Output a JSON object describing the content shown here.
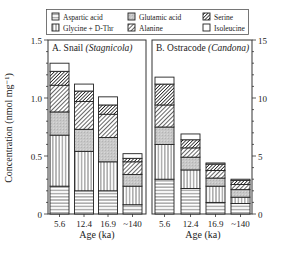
{
  "chart_data": [
    {
      "type": "bar",
      "stacked": true,
      "panel": "A",
      "title": "A. Snail (Stagnicola)",
      "title_plain": "A. Snail ",
      "title_italic": "(Stagnicola)",
      "xlabel": "Age (ka)",
      "ylabel": "Concentration (nmol mg⁻¹)",
      "ylim": [
        0,
        1.5
      ],
      "yticks": [
        "0",
        "0.5",
        "1.0",
        "1.5"
      ],
      "ytick_values": [
        0,
        0.5,
        1.0,
        1.5
      ],
      "axis_side": "left",
      "categories": [
        "5.6",
        "12.4",
        "16.9",
        "~140"
      ],
      "series": [
        {
          "name": "Aspartic acid",
          "values": [
            0.24,
            0.2,
            0.2,
            0.08
          ]
        },
        {
          "name": "Glycine + D-Thr",
          "values": [
            0.44,
            0.34,
            0.25,
            0.16
          ]
        },
        {
          "name": "Glutamic acid",
          "values": [
            0.2,
            0.19,
            0.21,
            0.1
          ]
        },
        {
          "name": "Alanine",
          "values": [
            0.23,
            0.24,
            0.2,
            0.11
          ]
        },
        {
          "name": "Serine",
          "values": [
            0.12,
            0.09,
            0.08,
            0.03
          ]
        },
        {
          "name": "Isoleucine",
          "values": [
            0.07,
            0.06,
            0.07,
            0.04
          ]
        }
      ],
      "totals": [
        1.3,
        1.12,
        1.01,
        0.52
      ]
    },
    {
      "type": "bar",
      "stacked": true,
      "panel": "B",
      "title": "B. Ostracode (Candona)",
      "title_plain": "B. Ostracode ",
      "title_italic": "(Candona)",
      "xlabel": "Age (ka)",
      "ylabel": "",
      "ylim": [
        0,
        15
      ],
      "yticks": [
        "0",
        "5",
        "10",
        "15"
      ],
      "ytick_values": [
        0,
        5,
        10,
        15
      ],
      "axis_side": "right",
      "categories": [
        "5.6",
        "12.4",
        "16.9",
        "~140"
      ],
      "series": [
        {
          "name": "Aspartic acid",
          "values": [
            3.0,
            2.2,
            1.0,
            0.9
          ]
        },
        {
          "name": "Glycine + D-Thr",
          "values": [
            3.0,
            1.6,
            1.4,
            0.55
          ]
        },
        {
          "name": "Glutamic acid",
          "values": [
            1.5,
            1.1,
            0.7,
            0.65
          ]
        },
        {
          "name": "Alanine",
          "values": [
            1.9,
            0.8,
            0.65,
            0.45
          ]
        },
        {
          "name": "Serine",
          "values": [
            1.8,
            0.7,
            0.55,
            0.35
          ]
        },
        {
          "name": "Isoleucine",
          "values": [
            0.6,
            0.5,
            0.1,
            0.1
          ]
        }
      ],
      "totals": [
        11.8,
        6.9,
        4.4,
        3.0
      ]
    }
  ],
  "legend": {
    "position": "top",
    "items": [
      {
        "name": "Aspartic acid",
        "pattern": "horizontal"
      },
      {
        "name": "Glutamic acid",
        "pattern": "gray"
      },
      {
        "name": "Serine",
        "pattern": "dense-diagonal"
      },
      {
        "name": "Glycine + D-Thr",
        "pattern": "vertical"
      },
      {
        "name": "Alanine",
        "pattern": "diagonal"
      },
      {
        "name": "Isoleucine",
        "pattern": "empty"
      }
    ]
  },
  "labels": {
    "ylabel": "Concentration (nmol mg⁻¹)",
    "xlabel_a": "Age (ka)",
    "xlabel_b": "Age (ka)"
  }
}
